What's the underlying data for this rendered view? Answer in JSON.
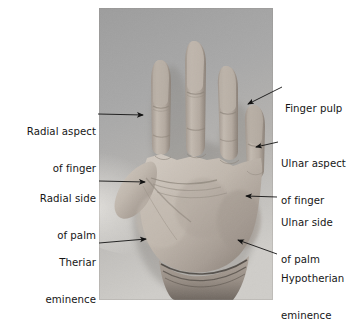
{
  "figure": {
    "type": "labelled-anatomical-photograph",
    "background_color": "#ffffff",
    "photo": {
      "x": 99,
      "y": 8,
      "width": 174,
      "height": 292,
      "color_mode": "grayscale",
      "background_tone": "#9a9a9a",
      "skin_tone_light": "#cfc6bd",
      "skin_tone_mid": "#ada39a",
      "skin_tone_dark": "#7e746c"
    },
    "arrow_color": "#1a1a1a"
  },
  "labels": {
    "left": [
      {
        "id": "radial-aspect-of-finger",
        "line1": "Radial aspect",
        "line2": "of finger",
        "text_x": 10,
        "text_y": 101,
        "text_width": 86,
        "align": "right",
        "arrow": {
          "x1": 98,
          "y1": 114,
          "x2": 143,
          "y2": 115
        }
      },
      {
        "id": "radial-side-of-palm",
        "line1": "Radial side",
        "line2": "of palm",
        "text_x": 16,
        "text_y": 168,
        "text_width": 80,
        "align": "right",
        "arrow": {
          "x1": 99,
          "y1": 181,
          "x2": 145,
          "y2": 182
        }
      },
      {
        "id": "thenar-eminence",
        "line1": "Theriar",
        "line2": "eminence",
        "text_x": 22,
        "text_y": 232,
        "text_width": 74,
        "align": "right",
        "arrow": {
          "x1": 99,
          "y1": 243,
          "x2": 146,
          "y2": 239
        }
      }
    ],
    "right": [
      {
        "id": "finger-pulp",
        "line1": "Finger pulp",
        "line2": "",
        "text_x": 285,
        "text_y": 78,
        "text_width": 74,
        "align": "left",
        "arrow": {
          "x1": 282,
          "y1": 87,
          "x2": 248,
          "y2": 104
        }
      },
      {
        "id": "ulnar-aspect-of-finger",
        "line1": "Ulnar aspect",
        "line2": "of finger",
        "text_x": 281,
        "text_y": 133,
        "text_width": 78,
        "align": "left",
        "arrow": {
          "x1": 278,
          "y1": 142,
          "x2": 256,
          "y2": 147
        }
      },
      {
        "id": "ulnar-side-of-palm",
        "line1": "Ulnar side",
        "line2": "of palm",
        "text_x": 281,
        "text_y": 192,
        "text_width": 70,
        "align": "left",
        "arrow": {
          "x1": 277,
          "y1": 197,
          "x2": 246,
          "y2": 196
        }
      },
      {
        "id": "hypothenar-eminence",
        "line1": "Hypotherian",
        "line2": "eminence",
        "text_x": 281,
        "text_y": 248,
        "text_width": 76,
        "align": "left",
        "arrow": {
          "x1": 277,
          "y1": 254,
          "x2": 238,
          "y2": 240
        }
      }
    ]
  }
}
